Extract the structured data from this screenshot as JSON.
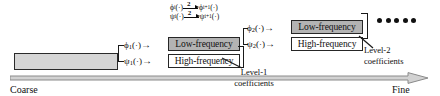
{
  "diagram": {
    "input_block": {
      "label": ""
    },
    "downsample": {
      "factor": "2",
      "direction_glyph": "↓",
      "rows": [
        {
          "from": "ϕ",
          "from_sub": "i",
          "to": "ϕ",
          "to_sub": "i+1",
          "arg": "(·)"
        },
        {
          "from": "ψ",
          "from_sub": "i",
          "to": "ψ",
          "to_sub": "i+1",
          "arg": "(·)"
        }
      ]
    },
    "levels": [
      {
        "id": "level-1",
        "lowpass_op": {
          "symbol": "ϕ",
          "sub": "1",
          "arg": "(·)",
          "arrow": "→"
        },
        "highpass_op": {
          "symbol": "ψ",
          "sub": "1",
          "arg": "(·)",
          "arrow": "→"
        },
        "low_box": "Low-frequency",
        "high_box": "High-frequency",
        "caption_line1": "Level-1",
        "caption_line2": "coefficients"
      },
      {
        "id": "level-2",
        "lowpass_op": {
          "symbol": "ϕ",
          "sub": "2",
          "arg": "(·)",
          "arrow": "→"
        },
        "highpass_op": {
          "symbol": "ψ",
          "sub": "2",
          "arg": "(·)",
          "arrow": "→"
        },
        "low_box": "Low-frequency",
        "high_box": "High-frequency",
        "caption_line1": "Level-2",
        "caption_line2": "coefficients"
      }
    ],
    "ellipsis_dots": 5,
    "scale_axis": {
      "left_label": "Coarse",
      "right_label": "Fine",
      "arrow_direction": "right"
    },
    "colors": {
      "lowpass_fill": "#b3b3b3",
      "highpass_fill": "#ffffff",
      "input_fill": "#d6d6d6",
      "stroke": "#262626",
      "axis": "#8a8a8a",
      "background": "#ffffff"
    }
  }
}
